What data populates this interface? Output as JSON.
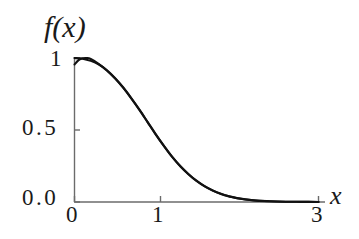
{
  "figure": {
    "background_color": "#ffffff",
    "axis_color": "#5a5a5a",
    "curve_color": "#111111"
  },
  "labels": {
    "ylabel": "f(x)",
    "xlabel": "x"
  },
  "ticks": {
    "y": [
      "1",
      "0.5",
      "0.0"
    ],
    "x": [
      "0",
      "1",
      "3"
    ]
  },
  "chart_data": {
    "type": "line",
    "title": "",
    "xlabel": "x",
    "ylabel": "f(x)",
    "xlim": [
      0,
      3
    ],
    "ylim": [
      0.0,
      1.05
    ],
    "xticks": [
      0,
      1,
      3
    ],
    "xticklabels": [
      "0",
      "1",
      "3"
    ],
    "yticks": [
      0.0,
      0.5,
      1.0
    ],
    "yticklabels": [
      "0.0",
      "0.5",
      "1"
    ],
    "grid": false,
    "legend": "none",
    "annotations": [
      "Two nearly coincident bell-shaped decay curves overlap; they separate visibly only near x = 0 where one starts at f = 1.00 and decreases monotonically while the other starts near f = 0.96, rises to a small maximum near x = 0.15, then rejoins the first curve."
    ],
    "series": [
      {
        "name": "curve-1",
        "x": [
          0.0,
          0.1,
          0.2,
          0.3,
          0.4,
          0.5,
          0.6,
          0.7,
          0.8,
          0.9,
          1.0,
          1.1,
          1.2,
          1.3,
          1.4,
          1.5,
          1.6,
          1.7,
          1.8,
          1.9,
          2.0,
          2.2,
          2.4,
          2.6,
          2.8,
          3.0
        ],
        "y": [
          1.0,
          0.995,
          0.98,
          0.955,
          0.915,
          0.86,
          0.795,
          0.72,
          0.64,
          0.555,
          0.47,
          0.39,
          0.315,
          0.25,
          0.195,
          0.148,
          0.11,
          0.08,
          0.057,
          0.04,
          0.027,
          0.012,
          0.005,
          0.002,
          0.001,
          0.0
        ]
      },
      {
        "name": "curve-2",
        "x": [
          0.0,
          0.05,
          0.1,
          0.15,
          0.2,
          0.3,
          0.4,
          0.5,
          0.6,
          0.7,
          0.8,
          0.9,
          1.0,
          1.1,
          1.2,
          1.3,
          1.4,
          1.5,
          1.6,
          1.7,
          1.8,
          1.9,
          2.0,
          2.2,
          2.4,
          2.6,
          2.8,
          3.0
        ],
        "y": [
          0.955,
          0.985,
          0.998,
          1.0,
          0.993,
          0.958,
          0.912,
          0.857,
          0.792,
          0.718,
          0.638,
          0.553,
          0.468,
          0.388,
          0.313,
          0.248,
          0.193,
          0.146,
          0.108,
          0.079,
          0.056,
          0.039,
          0.026,
          0.011,
          0.005,
          0.002,
          0.001,
          0.0
        ]
      }
    ]
  }
}
